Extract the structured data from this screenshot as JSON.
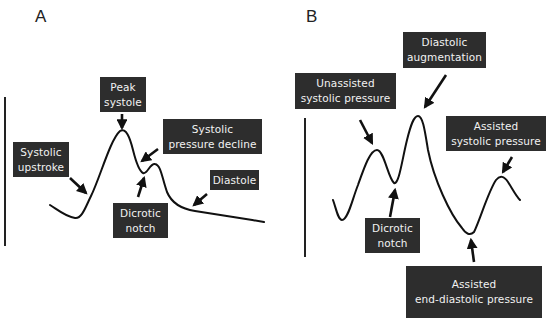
{
  "panels": [
    {
      "letter": "A",
      "labels": {
        "peak_systole": [
          "Peak",
          "systole"
        ],
        "systolic_pressure_decline": [
          "Systolic",
          "pressure decline"
        ],
        "systolic_upstroke": [
          "Systolic",
          "upstroke"
        ],
        "dicrotic_notch": [
          "Dicrotic",
          "notch"
        ],
        "diastole": [
          "Diastole"
        ]
      }
    },
    {
      "letter": "B",
      "labels": {
        "diastolic_augmentation": [
          "Diastolic",
          "augmentation"
        ],
        "unassisted_systolic_pressure": [
          "Unassisted",
          "systolic pressure"
        ],
        "assisted_systolic_pressure": [
          "Assisted",
          "systolic pressure"
        ],
        "dicrotic_notch": [
          "Dicrotic",
          "notch"
        ],
        "assisted_end_diastolic_pressure": [
          "Assisted",
          "end-diastolic pressure"
        ]
      }
    }
  ],
  "colors": {
    "label_bg": "#2d2d2d",
    "label_text": "#f2f2f2",
    "line": "#111111",
    "background": "#ffffff"
  }
}
